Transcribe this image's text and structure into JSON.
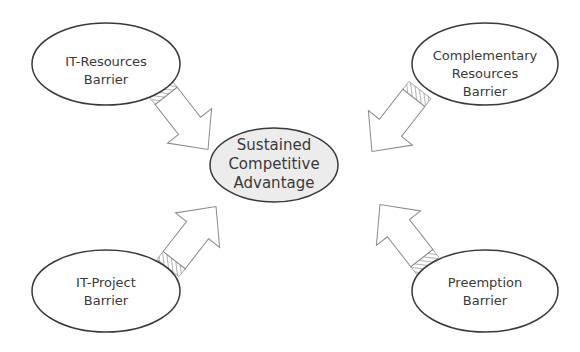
{
  "diagram": {
    "center": {
      "lines": [
        "Sustained",
        "Competitive",
        "Advantage"
      ],
      "fill": "#ececec"
    },
    "barriers": [
      {
        "id": "it-resources",
        "lines": [
          "IT-Resources",
          "Barrier"
        ]
      },
      {
        "id": "complementary-resources",
        "lines": [
          "Complementary",
          "Resources",
          "Barrier"
        ]
      },
      {
        "id": "it-project",
        "lines": [
          "IT-Project",
          "Barrier"
        ]
      },
      {
        "id": "preemption",
        "lines": [
          "Preemption",
          "Barrier"
        ]
      }
    ],
    "colors": {
      "stroke": "#3a3a3a",
      "arrow_stroke": "#8a8a8a",
      "node_fill": "#ffffff"
    }
  }
}
